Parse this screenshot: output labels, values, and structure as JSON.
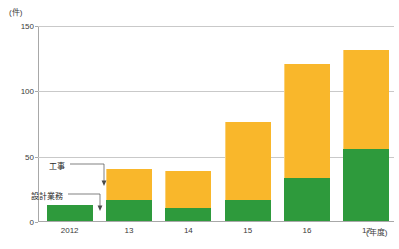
{
  "chart_data": {
    "type": "bar",
    "stacked": true,
    "title": "",
    "xlabel": "年度",
    "ylabel": "件",
    "unit_label": "(件)",
    "xaxis_unit_label": "(年度)",
    "categories": [
      "2012",
      "13",
      "14",
      "15",
      "16",
      "17"
    ],
    "series": [
      {
        "name": "設計業務",
        "color": "#2E9A3C",
        "values": [
          12,
          16,
          10,
          16,
          33,
          55
        ]
      },
      {
        "name": "工事",
        "color": "#F9B72B",
        "values": [
          0,
          24,
          28,
          60,
          87,
          76
        ]
      }
    ],
    "totals": [
      12,
      40,
      38,
      76,
      120,
      131
    ],
    "ylim": [
      0,
      150
    ],
    "yticks": [
      0,
      50,
      100,
      150
    ],
    "ytick_labels": [
      "0",
      "50",
      "100",
      "150"
    ],
    "grid": true,
    "legend_position": "inline-callouts"
  },
  "annotations": {
    "construction": {
      "label": "工事"
    },
    "design": {
      "label": "設計業務"
    }
  },
  "colors": {
    "green": "#2E9A3C",
    "orange": "#F9B72B",
    "axis": "#a8a8a8",
    "grid": "#c9c9c9",
    "text": "#3a3a3a"
  }
}
